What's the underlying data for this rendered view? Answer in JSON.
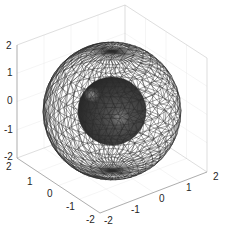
{
  "chart_data": {
    "type": "surface3d",
    "title": "",
    "xlabel": "",
    "ylabel": "",
    "zlabel": "",
    "grid": true,
    "view": "3d-default",
    "axes": {
      "x": {
        "range": [
          -2,
          2
        ],
        "ticks": [
          "-2",
          "-1",
          "0",
          "1",
          "2"
        ]
      },
      "y": {
        "range": [
          -2,
          2
        ],
        "ticks": [
          "-2",
          "-1",
          "0",
          "1",
          "2"
        ]
      },
      "z": {
        "range": [
          -2,
          2
        ],
        "ticks": [
          "-2",
          "-1",
          "0",
          "1",
          "2"
        ]
      }
    },
    "series": [
      {
        "name": "outer-sphere",
        "kind": "mesh-wireframe",
        "center": [
          0,
          0,
          0
        ],
        "radius": 2,
        "mesh_n": 40,
        "edge_color": "#2a2a2a",
        "face_color": "none"
      },
      {
        "name": "inner-sphere",
        "kind": "solid-surface",
        "center": [
          0,
          0,
          0
        ],
        "radius": 1,
        "face_color": "#3c3c3c",
        "highlight_color": "#9a9a9a"
      }
    ]
  },
  "labels": {
    "z_ticks": [
      {
        "text": "2",
        "x": 6,
        "y": 49
      },
      {
        "text": "1",
        "x": 7,
        "y": 76
      },
      {
        "text": "0",
        "x": 7,
        "y": 104
      },
      {
        "text": "-1",
        "x": 4,
        "y": 133
      },
      {
        "text": "-2",
        "x": 4,
        "y": 160
      }
    ],
    "y_ticks": [
      {
        "text": "2",
        "x": 6,
        "y": 170
      },
      {
        "text": "1",
        "x": 27,
        "y": 185
      },
      {
        "text": "0",
        "x": 47,
        "y": 197
      },
      {
        "text": "-1",
        "x": 66,
        "y": 210
      },
      {
        "text": "-2",
        "x": 86,
        "y": 223
      }
    ],
    "x_ticks": [
      {
        "text": "-2",
        "x": 104,
        "y": 224
      },
      {
        "text": "-1",
        "x": 131,
        "y": 213
      },
      {
        "text": "0",
        "x": 159,
        "y": 202
      },
      {
        "text": "1",
        "x": 186,
        "y": 191
      },
      {
        "text": "2",
        "x": 213,
        "y": 180
      }
    ]
  }
}
